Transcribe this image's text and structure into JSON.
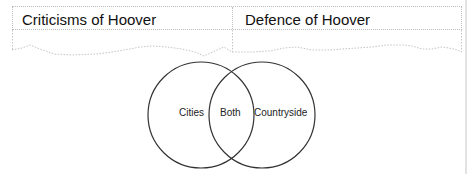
{
  "table": {
    "columns": [
      {
        "header": "Criticisms of Hoover"
      },
      {
        "header": "Defence of Hoover"
      }
    ]
  },
  "venn": {
    "left_label": "Cities",
    "middle_label": "Both",
    "right_label": "Countryside",
    "stroke_color": "#333333"
  }
}
